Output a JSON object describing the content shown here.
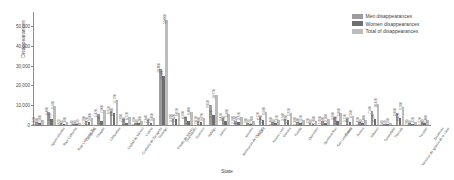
{
  "chart_data": {
    "type": "bar",
    "title": "",
    "xlabel": "State",
    "ylabel": "Disappearances",
    "ylim": [
      0,
      57000
    ],
    "yticks": [
      0,
      10000,
      20000,
      30000,
      40000,
      50000
    ],
    "ytick_labels": [
      "0",
      "10,000",
      "20,000",
      "30,000",
      "40,000",
      "50,000"
    ],
    "grid": false,
    "legend_position": "top-right",
    "categories": [
      "Aguascalientes",
      "Baja California",
      "Baja California Sur",
      "Campeche",
      "Chiapas",
      "Chihuahua",
      "Ciudad de México",
      "Coahuila de Zaragoza",
      "Colima",
      "Durango",
      "Estado de México",
      "Guanajuato",
      "Guerrero",
      "Hidalgo",
      "Jalisco",
      "Michoacán de Ocampo",
      "Morelos",
      "Nayarit",
      "Nuevo León",
      "Oaxaca",
      "Puebla",
      "Querétaro",
      "Quintana Roo",
      "San Luis Potosí",
      "Sinaloa",
      "Sonora",
      "Tabasco",
      "Tamaulipas",
      "Tlaxcala",
      "Veracruz de Ignacio de la Llave",
      "Yucatán",
      "Zacatecas"
    ],
    "series": [
      {
        "name": "Men disappearances",
        "color": "#9d9d9d",
        "values": [
          1320,
          6480,
          820,
          540,
          2180,
          5420,
          6950,
          2980,
          1260,
          2340,
          28400,
          3180,
          4260,
          2010,
          9850,
          3420,
          2180,
          1180,
          4120,
          1460,
          3240,
          1380,
          1120,
          1860,
          3980,
          3120,
          1420,
          7240,
          640,
          5860,
          780,
          1520
        ]
      },
      {
        "name": "Women disappearances",
        "color": "#6f6f6f",
        "values": [
          1180,
          3260,
          560,
          380,
          1420,
          2180,
          5840,
          1240,
          840,
          1120,
          24600,
          2840,
          2140,
          1680,
          5120,
          1960,
          1740,
          720,
          2460,
          860,
          2680,
          1140,
          760,
          1240,
          1880,
          1640,
          980,
          3180,
          520,
          3420,
          540,
          880
        ]
      },
      {
        "name": "Total of disappearances",
        "color": "#bcbcbc",
        "values": [
          2500,
          9740,
          1380,
          920,
          3600,
          7600,
          12790,
          4220,
          2100,
          3460,
          53000,
          6020,
          6400,
          3690,
          14970,
          5380,
          3920,
          1900,
          6580,
          2320,
          5920,
          2520,
          1880,
          3100,
          5860,
          4760,
          2400,
          10420,
          1160,
          9280,
          1320,
          2400
        ]
      }
    ]
  },
  "legend": {
    "items": [
      {
        "label": "Men disappearances",
        "color": "#9d9d9d"
      },
      {
        "label": "Women disappearances",
        "color": "#6f6f6f"
      },
      {
        "label": "Total of disappearances",
        "color": "#bcbcbc"
      }
    ]
  }
}
